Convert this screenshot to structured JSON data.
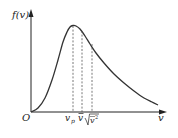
{
  "chart_data": {
    "type": "line",
    "title": "",
    "xlabel": "v",
    "ylabel": "f(v)",
    "origin_label": "O",
    "grid": false,
    "legend": null,
    "curve_points_px": [
      [
        31,
        112
      ],
      [
        38,
        108
      ],
      [
        45,
        98
      ],
      [
        52,
        80
      ],
      [
        58,
        60
      ],
      [
        63,
        42
      ],
      [
        67,
        32
      ],
      [
        70,
        27
      ],
      [
        73,
        25.5
      ],
      [
        76,
        26
      ],
      [
        80,
        29
      ],
      [
        85,
        36
      ],
      [
        90,
        44
      ],
      [
        96,
        53
      ],
      [
        104,
        63
      ],
      [
        114,
        74
      ],
      [
        124,
        83
      ],
      [
        134,
        91
      ],
      [
        144,
        98
      ],
      [
        152,
        102
      ],
      [
        158,
        105
      ]
    ],
    "annotations": [
      {
        "label": "v_p",
        "meaning": "most probable speed",
        "x_px": 73,
        "at_peak": true
      },
      {
        "label": "v̄",
        "meaning": "mean speed",
        "x_px": 82
      },
      {
        "label": "√(v̄²)",
        "meaning": "root-mean-square speed",
        "x_px": 92
      }
    ],
    "colors": {
      "axes": "#222222",
      "curve": "#333333",
      "dashed": "#555555"
    }
  },
  "labels": {
    "y_axis": "f(v)",
    "x_axis": "v",
    "origin": "O",
    "vp_main": "v",
    "vp_sub": "p",
    "vbar": "v",
    "vrms": "v",
    "vrms_sup": "2"
  }
}
